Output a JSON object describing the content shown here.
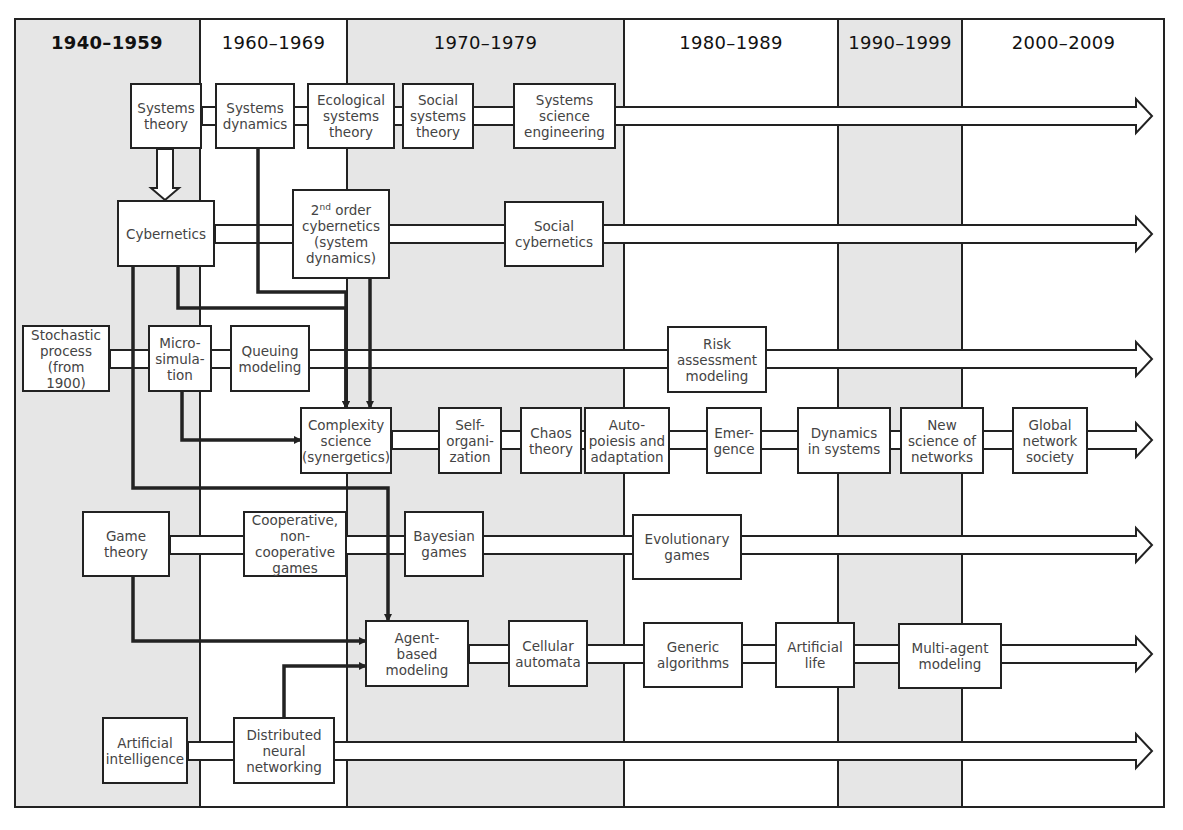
{
  "diagram": {
    "type": "timeline-flow",
    "frame": {
      "x": 14,
      "y": 18,
      "w": 1151,
      "h": 790
    },
    "columns": [
      {
        "label": "1940–1959",
        "x0": 14,
        "x1": 200,
        "shaded": true,
        "bold": true
      },
      {
        "label": "1960–1969",
        "x0": 200,
        "x1": 347,
        "shaded": false,
        "bold": false
      },
      {
        "label": "1970–1979",
        "x0": 347,
        "x1": 624,
        "shaded": true,
        "bold": false
      },
      {
        "label": "1980–1989",
        "x0": 624,
        "x1": 838,
        "shaded": false,
        "bold": false
      },
      {
        "label": "1990–1999",
        "x0": 838,
        "x1": 962,
        "shaded": true,
        "bold": false
      },
      {
        "label": "2000–2009",
        "x0": 962,
        "x1": 1165,
        "shaded": false,
        "bold": false
      }
    ],
    "colors": {
      "shade": "#e6e6e6",
      "line": "#222222",
      "text": "#444444",
      "box": "#ffffff"
    },
    "nodes": [
      {
        "id": "systems-theory",
        "label": "Systems\ntheory",
        "x": 130,
        "y": 83,
        "w": 72,
        "h": 66
      },
      {
        "id": "systems-dynamics",
        "label": "Systems\ndynamics",
        "x": 215,
        "y": 83,
        "w": 80,
        "h": 66
      },
      {
        "id": "ecological-systems-theory",
        "label": "Ecological\nsystems\ntheory",
        "x": 307,
        "y": 83,
        "w": 88,
        "h": 66
      },
      {
        "id": "social-systems-theory",
        "label": "Social\nsystems\ntheory",
        "x": 402,
        "y": 83,
        "w": 72,
        "h": 66
      },
      {
        "id": "systems-science-engineering",
        "label": "Systems\nscience\nengineering",
        "x": 513,
        "y": 83,
        "w": 103,
        "h": 66
      },
      {
        "id": "cybernetics",
        "label": "Cybernetics",
        "x": 117,
        "y": 200,
        "w": 98,
        "h": 67
      },
      {
        "id": "second-order-cybernetics",
        "label": "2nd order\ncybernetics\n(system\ndynamics)",
        "x": 292,
        "y": 189,
        "w": 98,
        "h": 90,
        "sup": true
      },
      {
        "id": "social-cybernetics",
        "label": "Social\ncybernetics",
        "x": 504,
        "y": 201,
        "w": 100,
        "h": 66
      },
      {
        "id": "stochastic-process",
        "label": "Stochastic\nprocess\n(from 1900)",
        "x": 22,
        "y": 325,
        "w": 88,
        "h": 67
      },
      {
        "id": "micro-simulation",
        "label": "Micro-\nsimulation",
        "x": 148,
        "y": 325,
        "w": 64,
        "h": 67,
        "label_override": "Micro-\nsimula-\ntion"
      },
      {
        "id": "queuing-modeling",
        "label": "Queuing\nmodeling",
        "x": 230,
        "y": 325,
        "w": 80,
        "h": 67
      },
      {
        "id": "risk-assessment-modeling",
        "label": "Risk\nassessment\nmodeling",
        "x": 667,
        "y": 326,
        "w": 100,
        "h": 67
      },
      {
        "id": "complexity-science",
        "label": "Complexity\nscience\n(synergetics)",
        "x": 300,
        "y": 407,
        "w": 92,
        "h": 67
      },
      {
        "id": "self-organization",
        "label": "Self-\norgani-\nzation",
        "x": 438,
        "y": 407,
        "w": 64,
        "h": 67
      },
      {
        "id": "chaos-theory",
        "label": "Chaos\ntheory",
        "x": 520,
        "y": 407,
        "w": 62,
        "h": 67
      },
      {
        "id": "autopoiesis-adaptation",
        "label": "Auto-\npoiesis and\nadaptation",
        "x": 584,
        "y": 407,
        "w": 86,
        "h": 67
      },
      {
        "id": "emergence",
        "label": "Emer-\ngence",
        "x": 706,
        "y": 407,
        "w": 56,
        "h": 67
      },
      {
        "id": "dynamics-in-systems",
        "label": "Dynamics\nin systems",
        "x": 797,
        "y": 407,
        "w": 94,
        "h": 67
      },
      {
        "id": "new-science-of-networks",
        "label": "New\nscience of\nnetworks",
        "x": 900,
        "y": 407,
        "w": 84,
        "h": 67
      },
      {
        "id": "global-network-society",
        "label": "Global\nnetwork\nsociety",
        "x": 1012,
        "y": 407,
        "w": 76,
        "h": 67
      },
      {
        "id": "game-theory",
        "label": "Game\ntheory",
        "x": 82,
        "y": 511,
        "w": 88,
        "h": 66
      },
      {
        "id": "cooperative-games",
        "label": "Cooperative,\nnon-cooperative\ngames",
        "x": 243,
        "y": 511,
        "w": 104,
        "h": 66
      },
      {
        "id": "bayesian-games",
        "label": "Bayesian\ngames",
        "x": 404,
        "y": 511,
        "w": 80,
        "h": 66
      },
      {
        "id": "evolutionary-games",
        "label": "Evolutionary\ngames",
        "x": 632,
        "y": 514,
        "w": 110,
        "h": 66
      },
      {
        "id": "agent-based-modeling",
        "label": "Agent-\nbased\nmodeling",
        "x": 365,
        "y": 620,
        "w": 104,
        "h": 67
      },
      {
        "id": "cellular-automata",
        "label": "Cellular\nautomata",
        "x": 508,
        "y": 620,
        "w": 80,
        "h": 67
      },
      {
        "id": "generic-algorithms",
        "label": "Generic\nalgorithms",
        "x": 643,
        "y": 622,
        "w": 100,
        "h": 66
      },
      {
        "id": "artificial-life",
        "label": "Artificial\nlife",
        "x": 775,
        "y": 622,
        "w": 80,
        "h": 66
      },
      {
        "id": "multi-agent-modeling",
        "label": "Multi-agent\nmodeling",
        "x": 898,
        "y": 623,
        "w": 104,
        "h": 66
      },
      {
        "id": "artificial-intelligence",
        "label": "Artificial\nintelligence",
        "x": 102,
        "y": 717,
        "w": 86,
        "h": 67
      },
      {
        "id": "distributed-neural-networking",
        "label": "Distributed\nneural\nnetworking",
        "x": 233,
        "y": 717,
        "w": 102,
        "h": 67
      }
    ],
    "tracks": [
      {
        "name": "systems-track",
        "y": 116,
        "x_start": 202,
        "x_end": 1152
      },
      {
        "name": "cybernetics-track",
        "y": 234,
        "x_start": 215,
        "x_end": 1152
      },
      {
        "name": "stochastic-track",
        "y": 359,
        "x_start": 110,
        "x_end": 1152
      },
      {
        "name": "complexity-track",
        "y": 440,
        "x_start": 392,
        "x_end": 1152
      },
      {
        "name": "game-track",
        "y": 545,
        "x_start": 170,
        "x_end": 1152
      },
      {
        "name": "agent-track",
        "y": 654,
        "x_start": 469,
        "x_end": 1152
      },
      {
        "name": "ai-track",
        "y": 751,
        "x_start": 188,
        "x_end": 1152
      }
    ],
    "connectors": [
      {
        "name": "systems-theory-to-cybernetics",
        "kind": "hollow-down-arrow",
        "x": 165,
        "y1": 149,
        "y2": 200
      },
      {
        "name": "systems-dynamics-to-complexity",
        "kind": "bold-arrow",
        "points": [
          [
            258,
            149
          ],
          [
            258,
            292
          ],
          [
            346,
            292
          ],
          [
            346,
            407
          ]
        ]
      },
      {
        "name": "second-order-to-complexity",
        "kind": "bold-arrow",
        "points": [
          [
            370,
            279
          ],
          [
            370,
            407
          ]
        ]
      },
      {
        "name": "cybernetics-to-complexity-left",
        "kind": "bold-arrow",
        "points": [
          [
            178,
            267
          ],
          [
            178,
            308
          ],
          [
            346,
            308
          ],
          [
            346,
            407
          ]
        ]
      },
      {
        "name": "microsim-to-complexity",
        "kind": "bold-arrow",
        "points": [
          [
            182,
            392
          ],
          [
            182,
            440
          ],
          [
            300,
            440
          ]
        ]
      },
      {
        "name": "cybernetics-to-bayesian",
        "kind": "bold-arrow",
        "points": [
          [
            133,
            267
          ],
          [
            133,
            488
          ],
          [
            388,
            488
          ],
          [
            388,
            620
          ]
        ]
      },
      {
        "name": "game-theory-to-agent",
        "kind": "bold-arrow",
        "points": [
          [
            133,
            577
          ],
          [
            133,
            641
          ],
          [
            365,
            641
          ]
        ]
      },
      {
        "name": "dnn-to-agent",
        "kind": "bold-arrow",
        "points": [
          [
            284,
            717
          ],
          [
            284,
            666
          ],
          [
            365,
            666
          ]
        ]
      }
    ]
  }
}
